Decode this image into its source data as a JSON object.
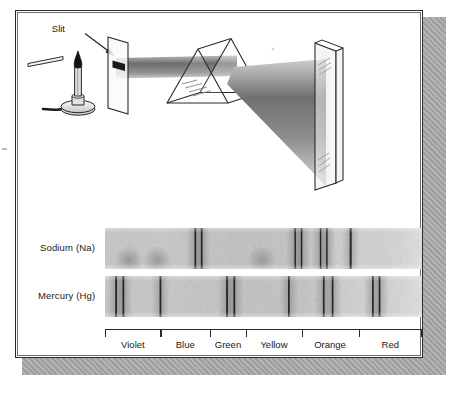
{
  "figure": {
    "kind": "spectroscopy-diagram",
    "palette": {
      "ink": "#2b2b2b",
      "panel_bg": "#ffffff",
      "shadow": "#a8a8a8",
      "band_light": "#d9d9d9",
      "band_dark": "#2a2a2a"
    }
  },
  "apparatus": {
    "slit_label": "Slit",
    "parts": [
      "bunsen-burner",
      "flame",
      "gas-hose",
      "slit-screen",
      "light-beam",
      "prism",
      "dispersed-beam",
      "viewing-screen"
    ]
  },
  "spectra": {
    "rows": [
      {
        "label": "Sodium (Na)",
        "element": "Na",
        "lines": [
          {
            "pos": 0.285,
            "width": 1.7,
            "intensity": 1.0
          },
          {
            "pos": 0.305,
            "width": 1.7,
            "intensity": 1.0
          },
          {
            "pos": 0.6,
            "width": 1.5,
            "intensity": 1.0
          },
          {
            "pos": 0.62,
            "width": 1.5,
            "intensity": 1.0
          },
          {
            "pos": 0.68,
            "width": 1.5,
            "intensity": 1.0
          },
          {
            "pos": 0.7,
            "width": 1.5,
            "intensity": 1.0
          },
          {
            "pos": 0.775,
            "width": 2.0,
            "intensity": 1.0
          }
        ],
        "glows": [
          {
            "pos": 0.075,
            "intensity": 0.55
          },
          {
            "pos": 0.165,
            "intensity": 0.55
          },
          {
            "pos": 0.495,
            "intensity": 0.5
          }
        ]
      },
      {
        "label": "Mercury (Hg)",
        "element": "Hg",
        "lines": [
          {
            "pos": 0.035,
            "width": 1.8,
            "intensity": 1.0
          },
          {
            "pos": 0.058,
            "width": 1.8,
            "intensity": 1.0
          },
          {
            "pos": 0.175,
            "width": 1.8,
            "intensity": 1.0
          },
          {
            "pos": 0.385,
            "width": 1.8,
            "intensity": 1.0
          },
          {
            "pos": 0.408,
            "width": 1.8,
            "intensity": 1.0
          },
          {
            "pos": 0.58,
            "width": 1.7,
            "intensity": 1.0
          },
          {
            "pos": 0.69,
            "width": 1.7,
            "intensity": 1.0
          },
          {
            "pos": 0.718,
            "width": 1.7,
            "intensity": 1.0
          },
          {
            "pos": 0.845,
            "width": 1.7,
            "intensity": 1.0
          },
          {
            "pos": 0.866,
            "width": 1.7,
            "intensity": 1.0
          }
        ],
        "glows": []
      }
    ]
  },
  "color_axis": {
    "ticks": [
      0.0,
      0.175,
      0.33,
      0.445,
      0.62,
      0.8,
      1.0
    ],
    "bands": [
      {
        "label": "Violet",
        "center": 0.088
      },
      {
        "label": "Blue",
        "center": 0.253
      },
      {
        "label": "Green",
        "center": 0.388
      },
      {
        "label": "Yellow",
        "center": 0.533
      },
      {
        "label": "Orange",
        "center": 0.71
      },
      {
        "label": "Red",
        "center": 0.9
      }
    ]
  }
}
